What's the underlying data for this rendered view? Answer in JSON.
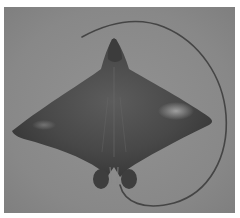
{
  "image": {
    "subject": "eagle ray",
    "alt": "Photograph of an eagle ray (dorsal view) with long whip-like tail on a gray background",
    "colors": {
      "background": "#8a8a8a",
      "body_dark": "#3a3a3a",
      "body_mid": "#555555",
      "highlight": "#9a9a9a",
      "tail": "#444444",
      "border": "#ffffff"
    }
  }
}
